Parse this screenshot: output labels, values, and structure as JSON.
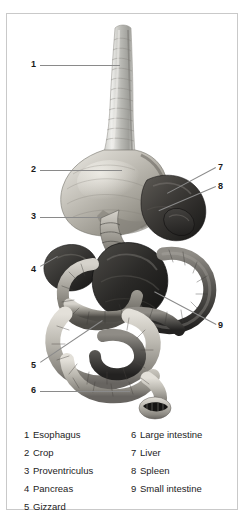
{
  "figure": {
    "frame_color": "#c9c9c9",
    "leader_color": "#8a8a8a",
    "label_color": "#1a1a1a"
  },
  "callouts": [
    {
      "num": "1",
      "organ": "Esophagus",
      "x": 24,
      "y": 46,
      "line_x": 33,
      "line_y": 51,
      "line_len": 80,
      "line_angle": 0
    },
    {
      "num": "2",
      "organ": "Crop",
      "x": 24,
      "y": 151,
      "line_x": 33,
      "line_y": 156,
      "line_len": 82,
      "line_angle": 0
    },
    {
      "num": "3",
      "organ": "Proventriculus",
      "x": 24,
      "y": 198,
      "line_x": 33,
      "line_y": 203,
      "line_len": 61,
      "line_angle": 0
    },
    {
      "num": "4",
      "organ": "Pancreas",
      "x": 24,
      "y": 251,
      "line_x": 33,
      "line_y": 252,
      "line_len": 20,
      "line_angle": -30
    },
    {
      "num": "5",
      "organ": "Gizzard",
      "x": 24,
      "y": 347,
      "line_x": 33,
      "line_y": 348,
      "line_len": 75,
      "line_angle": -34
    },
    {
      "num": "6",
      "organ": "Large intestine",
      "x": 24,
      "y": 372,
      "line_x": 33,
      "line_y": 377,
      "line_len": 90,
      "line_angle": 0
    },
    {
      "num": "7",
      "organ": "Liver",
      "x": 211,
      "y": 149,
      "line_x": 209,
      "line_y": 154,
      "line_len": 55,
      "line_angle": 152
    },
    {
      "num": "8",
      "organ": "Spleen",
      "x": 211,
      "y": 168,
      "line_x": 209,
      "line_y": 173,
      "line_len": 62,
      "line_angle": 157
    },
    {
      "num": "9",
      "organ": "Small intestine",
      "x": 211,
      "y": 307,
      "line_x": 209,
      "line_y": 311,
      "line_len": 70,
      "line_angle": 208
    }
  ],
  "legend": {
    "left_column": [
      {
        "num": "1",
        "label": "Esophagus"
      },
      {
        "num": "2",
        "label": "Crop"
      },
      {
        "num": "3",
        "label": "Proventriculus"
      },
      {
        "num": "4",
        "label": "Pancreas"
      },
      {
        "num": "5",
        "label": "Gizzard"
      }
    ],
    "right_column": [
      {
        "num": "6",
        "label": "Large intestine"
      },
      {
        "num": "7",
        "label": "Liver"
      },
      {
        "num": "8",
        "label": "Spleen"
      },
      {
        "num": "9",
        "label": "Small intestine"
      }
    ]
  }
}
